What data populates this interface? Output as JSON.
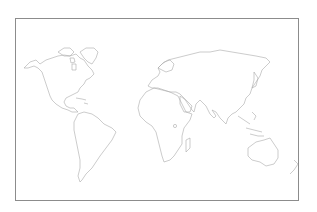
{
  "map": {
    "type": "world-outline",
    "projection": "equirectangular-style",
    "labels": [],
    "colors": {
      "background": "#ffffff",
      "frame": "#8c8c8c",
      "coastline": "#a9a9a9"
    },
    "features": [
      "north-america",
      "greenland",
      "south-america",
      "europe",
      "africa",
      "madagascar",
      "asia",
      "japan",
      "southeast-asia-islands",
      "australia",
      "new-zealand"
    ]
  }
}
